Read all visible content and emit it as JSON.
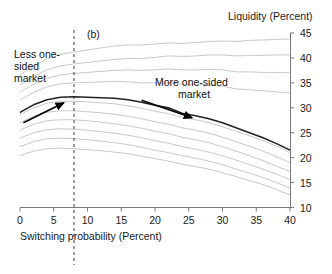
{
  "chart_data": {
    "type": "line",
    "title": "",
    "panel_label": "(b)",
    "xlabel": "Switching probability (Percent)",
    "ylabel": "Liquidity (Percent)",
    "xlim": [
      0,
      40
    ],
    "ylim": [
      10,
      45
    ],
    "xticks": [
      0,
      5,
      10,
      15,
      20,
      25,
      30,
      35,
      40
    ],
    "yticks": [
      10,
      15,
      20,
      25,
      30,
      35,
      40,
      45
    ],
    "xtick_labels": [
      "0",
      "5",
      "10",
      "15",
      "20",
      "25",
      "30",
      "35",
      "40"
    ],
    "ytick_labels": [
      "10",
      "15",
      "20",
      "25",
      "30",
      "35",
      "40",
      "45"
    ],
    "y_axis_position": "right",
    "grid": false,
    "legend": "none",
    "x": [
      0,
      2,
      4,
      6,
      8,
      10,
      12,
      14,
      16,
      18,
      20,
      22,
      24,
      26,
      28,
      30,
      32,
      34,
      36,
      38,
      40
    ],
    "series": [
      {
        "name": "curve-1",
        "style": "light",
        "color": "#c9c9c9",
        "values": [
          36.6,
          38.4,
          39.8,
          40.7,
          41.2,
          41.6,
          42.0,
          42.4,
          42.6,
          42.6,
          42.8,
          43.0,
          42.9,
          43.1,
          43.3,
          43.4,
          43.3,
          43.5,
          43.6,
          43.7,
          43.8
        ]
      },
      {
        "name": "curve-2",
        "style": "light",
        "color": "#c9c9c9",
        "values": [
          34.6,
          36.3,
          37.6,
          38.4,
          38.8,
          39.1,
          39.4,
          39.7,
          39.9,
          39.9,
          40.1,
          40.4,
          40.3,
          40.4,
          40.6,
          40.6,
          40.4,
          40.5,
          40.5,
          40.6,
          40.6
        ]
      },
      {
        "name": "curve-3",
        "style": "light",
        "color": "#c9c9c9",
        "values": [
          33.1,
          34.7,
          35.9,
          36.6,
          36.9,
          37.1,
          37.3,
          37.5,
          37.6,
          37.5,
          37.6,
          37.8,
          37.6,
          37.6,
          37.7,
          37.6,
          37.2,
          37.2,
          37.1,
          37.1,
          37.0
        ]
      },
      {
        "name": "curve-4",
        "style": "light",
        "color": "#c9c9c9",
        "values": [
          31.6,
          33.1,
          34.2,
          34.8,
          35.0,
          35.1,
          35.2,
          35.3,
          35.2,
          35.0,
          35.0,
          35.0,
          34.7,
          34.6,
          34.6,
          34.3,
          33.8,
          33.6,
          33.4,
          33.2,
          33.0
        ]
      },
      {
        "name": "curve-5-highlight",
        "style": "dark",
        "color": "#222222",
        "values": [
          29.1,
          30.6,
          31.6,
          32.1,
          32.2,
          32.1,
          32.0,
          31.9,
          31.6,
          31.1,
          30.5,
          30.0,
          28.9,
          28.4,
          27.8,
          27.0,
          26.0,
          25.0,
          24.0,
          22.8,
          21.5
        ]
      },
      {
        "name": "curve-6",
        "style": "light",
        "color": "#c9c9c9",
        "values": [
          28.6,
          30.0,
          30.9,
          31.3,
          31.3,
          31.2,
          31.0,
          30.8,
          30.4,
          29.9,
          29.3,
          28.8,
          28.1,
          27.6,
          27.0,
          26.2,
          25.3,
          24.4,
          23.4,
          22.3,
          21.0
        ]
      },
      {
        "name": "curve-7",
        "style": "light",
        "color": "#c9c9c9",
        "values": [
          27.0,
          28.3,
          29.1,
          29.4,
          29.4,
          29.2,
          29.0,
          28.7,
          28.3,
          27.8,
          27.2,
          26.7,
          26.0,
          25.5,
          24.9,
          24.1,
          23.2,
          22.3,
          21.3,
          20.2,
          19.0
        ]
      },
      {
        "name": "curve-8",
        "style": "light",
        "color": "#c9c9c9",
        "values": [
          25.5,
          26.7,
          27.4,
          27.6,
          27.6,
          27.4,
          27.1,
          26.8,
          26.4,
          25.9,
          25.3,
          24.8,
          24.1,
          23.6,
          23.0,
          22.2,
          21.3,
          20.4,
          19.4,
          18.3,
          17.2
        ]
      },
      {
        "name": "curve-9",
        "style": "light",
        "color": "#c9c9c9",
        "values": [
          23.9,
          25.0,
          25.6,
          25.8,
          25.7,
          25.5,
          25.2,
          24.9,
          24.5,
          24.0,
          23.4,
          22.9,
          22.2,
          21.7,
          21.1,
          20.4,
          19.5,
          18.6,
          17.7,
          16.7,
          15.6
        ]
      },
      {
        "name": "curve-10",
        "style": "light",
        "color": "#c9c9c9",
        "values": [
          22.2,
          23.2,
          23.8,
          23.9,
          23.8,
          23.6,
          23.3,
          23.0,
          22.6,
          22.1,
          21.5,
          21.0,
          20.4,
          19.9,
          19.3,
          18.6,
          17.7,
          16.9,
          16.0,
          15.0,
          13.9
        ]
      },
      {
        "name": "curve-11",
        "style": "light",
        "color": "#c9c9c9",
        "values": [
          20.4,
          21.3,
          21.8,
          21.9,
          21.8,
          21.6,
          21.4,
          21.1,
          20.8,
          20.3,
          19.8,
          19.3,
          18.7,
          18.2,
          17.7,
          17.0,
          16.2,
          15.4,
          14.6,
          13.6,
          12.5
        ]
      }
    ],
    "vertical_reference_line": {
      "x": 8,
      "style": "dashed",
      "color": "#3a3a3a"
    },
    "annotations": [
      {
        "id": "less-one-sided",
        "lines": [
          "Less one-",
          "sided",
          "market"
        ],
        "text": "Less one-sided market",
        "arrow_from": [
          0.5,
          27.0
        ],
        "arrow_to": [
          6.5,
          31.0
        ]
      },
      {
        "id": "more-one-sided",
        "lines": [
          "More one-sided",
          "market"
        ],
        "text": "More one-sided market",
        "arrow_from": [
          18.0,
          31.5
        ],
        "arrow_to": [
          25.5,
          28.0
        ]
      }
    ]
  }
}
